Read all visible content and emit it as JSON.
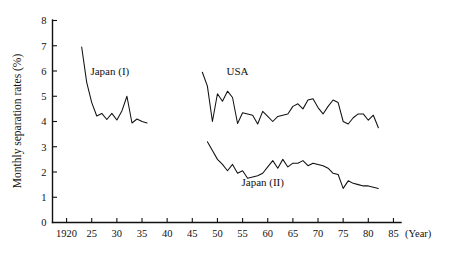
{
  "chart_data": {
    "type": "line",
    "title": "",
    "subtitle": "",
    "xlabel": "(Year)",
    "ylabel": "Monthly separation rates (%)",
    "xlim": [
      1918,
      1987
    ],
    "ylim": [
      0,
      8
    ],
    "grid": false,
    "legend_position": "inline-annotations",
    "x_unit_suffix": "(Year)",
    "xticks": [
      {
        "value": 1920,
        "label": "1920"
      },
      {
        "value": 1925,
        "label": "25"
      },
      {
        "value": 1930,
        "label": "30"
      },
      {
        "value": 1935,
        "label": "35"
      },
      {
        "value": 1940,
        "label": "40"
      },
      {
        "value": 1945,
        "label": "45"
      },
      {
        "value": 1950,
        "label": "50"
      },
      {
        "value": 1955,
        "label": "55"
      },
      {
        "value": 1960,
        "label": "60"
      },
      {
        "value": 1965,
        "label": "65"
      },
      {
        "value": 1970,
        "label": "70"
      },
      {
        "value": 1975,
        "label": "75"
      },
      {
        "value": 1980,
        "label": "80"
      },
      {
        "value": 1985,
        "label": "85"
      }
    ],
    "yticks": [
      {
        "value": 0,
        "label": "0"
      },
      {
        "value": 1,
        "label": "1"
      },
      {
        "value": 2,
        "label": "2"
      },
      {
        "value": 3,
        "label": "3"
      },
      {
        "value": 4,
        "label": "4"
      },
      {
        "value": 5,
        "label": "5"
      },
      {
        "value": 6,
        "label": "6"
      },
      {
        "value": 7,
        "label": "7"
      },
      {
        "value": 8,
        "label": "8"
      }
    ],
    "annotations": [
      {
        "name": "japan-i-label",
        "text": "Japan (I)",
        "x": 1928.6,
        "y": 5.85
      },
      {
        "name": "usa-label",
        "text": "USA",
        "x": 1954.0,
        "y": 5.85
      },
      {
        "name": "japan-ii-label",
        "text": "Japan (II)",
        "x": 1959.0,
        "y": 1.45
      }
    ],
    "series": [
      {
        "name": "Japan (I)",
        "x": [
          1923,
          1924,
          1925,
          1926,
          1927,
          1928,
          1929,
          1930,
          1931,
          1932,
          1933,
          1934,
          1935,
          1936
        ],
        "values": [
          6.95,
          5.55,
          4.75,
          4.22,
          4.32,
          4.08,
          4.32,
          4.06,
          4.42,
          5.0,
          3.94,
          4.1,
          4.0,
          3.94
        ]
      },
      {
        "name": "USA",
        "x": [
          1947,
          1948,
          1949,
          1950,
          1951,
          1952,
          1953,
          1954,
          1955,
          1956,
          1957,
          1958,
          1959,
          1960,
          1961,
          1962,
          1963,
          1964,
          1965,
          1966,
          1967,
          1968,
          1969,
          1970,
          1971,
          1972,
          1973,
          1974,
          1975,
          1976,
          1977,
          1978,
          1979,
          1980,
          1981,
          1982
        ],
        "values": [
          5.95,
          5.4,
          4.0,
          5.1,
          4.8,
          5.2,
          4.95,
          3.92,
          4.35,
          4.3,
          4.25,
          3.9,
          4.4,
          4.2,
          4.0,
          4.2,
          4.25,
          4.3,
          4.6,
          4.7,
          4.5,
          4.85,
          4.9,
          4.55,
          4.3,
          4.6,
          4.85,
          4.75,
          4.0,
          3.9,
          4.15,
          4.3,
          4.3,
          4.05,
          4.25,
          3.75
        ]
      },
      {
        "name": "Japan (II)",
        "x": [
          1948,
          1949,
          1950,
          1951,
          1952,
          1953,
          1954,
          1955,
          1956,
          1957,
          1958,
          1959,
          1960,
          1961,
          1962,
          1963,
          1964,
          1965,
          1966,
          1967,
          1968,
          1969,
          1970,
          1971,
          1972,
          1973,
          1974,
          1975,
          1976,
          1977,
          1978,
          1979,
          1980,
          1981,
          1982
        ],
        "values": [
          3.2,
          2.85,
          2.5,
          2.3,
          2.05,
          2.3,
          1.95,
          2.05,
          1.75,
          1.8,
          1.85,
          1.95,
          2.2,
          2.45,
          2.15,
          2.5,
          2.2,
          2.35,
          2.35,
          2.45,
          2.25,
          2.35,
          2.3,
          2.25,
          2.15,
          1.95,
          1.9,
          1.35,
          1.65,
          1.55,
          1.5,
          1.45,
          1.45,
          1.4,
          1.35
        ]
      }
    ]
  }
}
